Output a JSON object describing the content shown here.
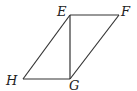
{
  "diagram": {
    "type": "parallelogram",
    "points": {
      "E": {
        "x": 70,
        "y": 15,
        "label": "E"
      },
      "F": {
        "x": 119,
        "y": 15,
        "label": "F"
      },
      "G": {
        "x": 70,
        "y": 79,
        "label": "G"
      },
      "H": {
        "x": 23,
        "y": 79,
        "label": "H"
      }
    },
    "segments": [
      [
        "E",
        "F"
      ],
      [
        "F",
        "G"
      ],
      [
        "G",
        "H"
      ],
      [
        "H",
        "E"
      ],
      [
        "E",
        "G"
      ]
    ],
    "stroke_color": "#333333"
  }
}
